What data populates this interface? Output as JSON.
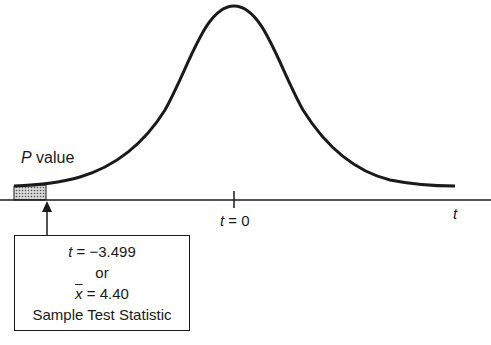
{
  "diagram": {
    "curve": "bell-shaped t distribution",
    "shaded_region": "left tail (P value)",
    "colors": {
      "line": "#1a1a1a",
      "shade": "#bdbdbd",
      "background": "#ffffff"
    }
  },
  "labels": {
    "p_value_italic": "P",
    "p_value_rest": " value",
    "center_t": "t",
    "center_eq": " = 0",
    "axis_label": "t"
  },
  "statistic_box": {
    "line1_var": "t",
    "line1_rest": " = −3.499",
    "line2": "or",
    "line3_var": "x",
    "line3_rest": " = 4.40",
    "line4": "Sample Test Statistic"
  }
}
